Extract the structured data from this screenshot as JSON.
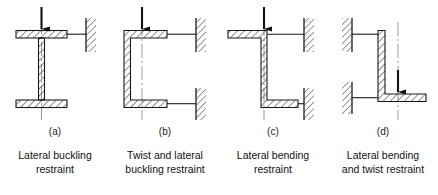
{
  "figure": {
    "background": "#ffffff",
    "line_color": "#1a1a1a",
    "hatch_color": "#2b2b2b",
    "centerline_color": "#6a6a6a"
  },
  "panels": [
    {
      "key": "a",
      "label": "(a)",
      "section_type": "I-section",
      "restraint_icon": "hatched-wall-support",
      "load_icon": "down-arrow",
      "wall_side": "right",
      "wall_count": 1,
      "caption_lines": [
        "Lateral buckling",
        "restraint"
      ],
      "caption_text": "Lateral buckling restraint"
    },
    {
      "key": "b",
      "label": "(b)",
      "section_type": "C-channel",
      "restraint_icon": "hatched-wall-support",
      "load_icon": "down-arrow",
      "wall_side": "right",
      "wall_count": 2,
      "caption_lines": [
        "Twist and lateral",
        "buckling restraint"
      ],
      "caption_text": "Twist and lateral buckling restraint"
    },
    {
      "key": "c",
      "label": "(c)",
      "section_type": "Z-section",
      "restraint_icon": "hatched-wall-support",
      "load_icon": "down-arrow",
      "wall_side": "right",
      "wall_count": 2,
      "caption_lines": [
        "Lateral bending",
        "restraint"
      ],
      "caption_text": "Lateral bending restraint"
    },
    {
      "key": "d",
      "label": "(d)",
      "section_type": "Angle-section",
      "restraint_icon": "hatched-wall-support",
      "load_icon": "down-arrow",
      "wall_side": "left",
      "wall_count": 2,
      "caption_lines": [
        "Lateral bending",
        "and twist restraint"
      ],
      "caption_text": "Lateral bending and twist restraint"
    }
  ]
}
